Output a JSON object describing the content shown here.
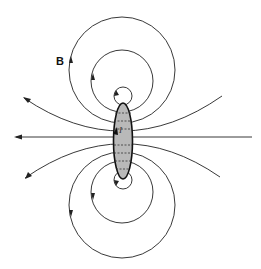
{
  "figure": {
    "labels": {
      "field": "B",
      "current": "I"
    },
    "colors": {
      "line": "#222222",
      "loop_fill": "#b9b9b9",
      "background": "#ffffff"
    }
  }
}
